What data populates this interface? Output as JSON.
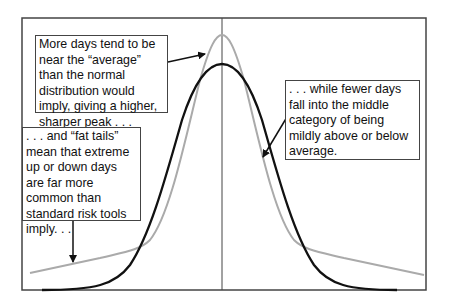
{
  "annotations": {
    "peak": "More days tend to be near the “average” than the normal distribution would imply, giving a higher, sharper peak . . .",
    "tails": ". . . and “fat tails” mean that extreme up or down days are far more common than standard risk tools imply. . .",
    "middle": ". . . while fewer days fall into the middle category of being mildly above or below average."
  },
  "colors": {
    "fat_tail_curve": "#aaaaaa",
    "normal_curve": "#111111",
    "frame": "#444444"
  },
  "curves": [
    {
      "name": "fat-tailed distribution",
      "color": "#aaaaaa"
    },
    {
      "name": "normal distribution",
      "color": "#111111"
    }
  ]
}
